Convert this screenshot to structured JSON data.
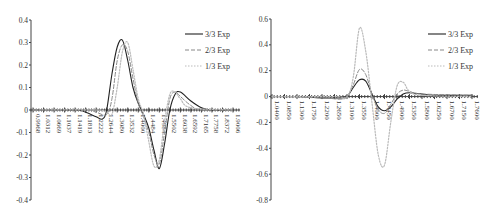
{
  "chart_data": [
    {
      "type": "line",
      "title": "",
      "xlabel": "",
      "ylabel": "",
      "ylim": [
        -0.4,
        0.4
      ],
      "yticks": [
        "0.4",
        "0.3",
        "0.2",
        "0.1",
        "0",
        "-0.1",
        "-0.2",
        "-0.3",
        "-0.4"
      ],
      "ytick_values": [
        0.4,
        0.3,
        0.2,
        0.1,
        0,
        -0.1,
        -0.2,
        -0.3,
        -0.4
      ],
      "x_tick_labels": [
        "0.9968",
        "1.0312",
        "1.0669",
        "1.1037",
        "1.1419",
        "1.1813",
        "1.2222",
        "1.2644",
        "1.3080",
        "1.3532",
        "1.4000",
        "1.4484",
        "1.4984",
        "1.5502",
        "1.6038",
        "1.6592",
        "1.7165",
        "1.7758",
        "1.8372",
        "1.9006"
      ],
      "legend": {
        "placement": "top-right",
        "entries": [
          "3/3 Exp",
          "2/3 Exp",
          "1/3 Exp"
        ]
      },
      "grid": false,
      "series": [
        {
          "name": "3/3 Exp",
          "style": "solid",
          "color": "#222222",
          "x_index": [
            0,
            4,
            5,
            6,
            6.6,
            7,
            7.5,
            8,
            8.5,
            9,
            9.5,
            10,
            10.5,
            11,
            11.5,
            12,
            12.5,
            13,
            13.5,
            14,
            15,
            16,
            17,
            19
          ],
          "values": [
            0,
            0,
            -0.01,
            -0.03,
            -0.04,
            0.0,
            0.16,
            0.28,
            0.31,
            0.22,
            0.1,
            0.03,
            -0.02,
            -0.08,
            -0.18,
            -0.26,
            -0.15,
            0.0,
            0.07,
            0.08,
            0.04,
            0.01,
            0,
            0
          ]
        },
        {
          "name": "2/3 Exp",
          "style": "dashed",
          "color": "#888888",
          "x_index": [
            0,
            5,
            6,
            7,
            7.5,
            8,
            8.5,
            9,
            9.5,
            10,
            10.5,
            11,
            11.5,
            12,
            12.5,
            13,
            13.5,
            14,
            15,
            16,
            19
          ],
          "values": [
            0,
            0,
            -0.01,
            -0.02,
            0.05,
            0.22,
            0.29,
            0.26,
            0.14,
            0.03,
            -0.03,
            -0.1,
            -0.2,
            -0.24,
            -0.1,
            0.05,
            0.08,
            0.06,
            0.02,
            0.0,
            0
          ]
        },
        {
          "name": "1/3 Exp",
          "style": "dotted",
          "color": "#bbbbbb",
          "x_index": [
            0,
            6,
            7,
            7.5,
            8,
            8.5,
            9,
            9.5,
            10,
            10.5,
            11,
            11.5,
            12,
            12.5,
            13,
            13.5,
            14,
            15,
            19
          ],
          "values": [
            0,
            0,
            -0.01,
            -0.02,
            0.1,
            0.26,
            0.3,
            0.18,
            0.05,
            -0.02,
            -0.14,
            -0.25,
            -0.22,
            -0.05,
            0.07,
            0.08,
            0.05,
            0.01,
            0
          ]
        }
      ]
    },
    {
      "type": "line",
      "title": "",
      "xlabel": "",
      "ylabel": "",
      "ylim": [
        -0.8,
        0.6
      ],
      "yticks": [
        "0.6",
        "0.4",
        "0.2",
        "0",
        "-0.2",
        "-0.4",
        "-0.6",
        "-0.8"
      ],
      "ytick_values": [
        0.6,
        0.4,
        0.2,
        0,
        -0.2,
        -0.4,
        -0.6,
        -0.8
      ],
      "x_tick_labels": [
        "1.0400",
        "1.0850",
        "1.1300",
        "1.1750",
        "1.2200",
        "1.2650",
        "1.3100",
        "1.3550",
        "1.4000",
        "1.4450",
        "1.4900",
        "1.5350",
        "1.5800",
        "1.6250",
        "1.6700",
        "1.7150",
        "1.7600"
      ],
      "legend": {
        "placement": "top-right",
        "entries": [
          "3/3 Exp",
          "2/3 Exp",
          "1/3 Exp"
        ]
      },
      "grid": false,
      "series": [
        {
          "name": "3/3 Exp",
          "style": "solid",
          "color": "#222222",
          "x_index": [
            0,
            2,
            4,
            5.5,
            6,
            6.5,
            7,
            7.5,
            8,
            8.5,
            9,
            9.5,
            10,
            10.5,
            11,
            12,
            13,
            16
          ],
          "values": [
            0,
            0.0,
            -0.01,
            -0.01,
            0.0,
            0.07,
            0.13,
            0.12,
            0.02,
            -0.08,
            -0.11,
            -0.08,
            -0.02,
            0.02,
            0.03,
            0.02,
            0.01,
            0.01
          ]
        },
        {
          "name": "2/3 Exp",
          "style": "dashed",
          "color": "#888888",
          "x_index": [
            0,
            4,
            5.5,
            6,
            6.5,
            7,
            7.5,
            8,
            8.5,
            9,
            9.5,
            10,
            10.5,
            11,
            12,
            16
          ],
          "values": [
            0,
            -0.01,
            -0.02,
            0.0,
            0.09,
            0.21,
            0.17,
            0.02,
            -0.1,
            -0.13,
            -0.06,
            0.02,
            0.05,
            0.04,
            0.02,
            0.01
          ]
        },
        {
          "name": "1/3 Exp",
          "style": "dotted",
          "color": "#bbbbbb",
          "x_index": [
            0,
            5,
            6,
            6.5,
            7,
            7.5,
            8,
            8.5,
            9,
            9.5,
            10,
            10.5,
            11,
            12,
            16
          ],
          "values": [
            0,
            0,
            0.0,
            0.15,
            0.53,
            0.35,
            -0.05,
            -0.45,
            -0.53,
            -0.2,
            0.08,
            0.11,
            0.04,
            0.01,
            0.0
          ]
        }
      ]
    }
  ]
}
